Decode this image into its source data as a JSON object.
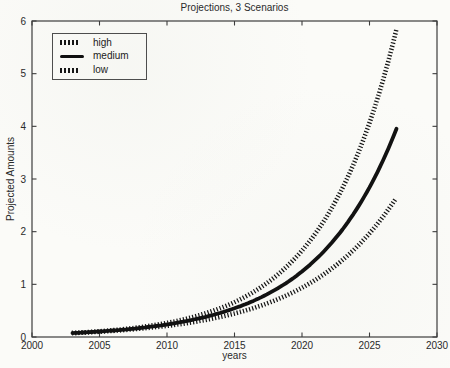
{
  "title": "Projections, 3 Scenarios",
  "axes": {
    "xlabel": "years",
    "ylabel": "Projected Amounts"
  },
  "legend": {
    "items": [
      {
        "label": "high",
        "style": "dotted"
      },
      {
        "label": "medium",
        "style": "solid-thick"
      },
      {
        "label": "low",
        "style": "dotted"
      }
    ],
    "position": "upper-left"
  },
  "colors": {
    "background": "#fbfbf8",
    "axis": "#3d3d3d",
    "text": "#2a2a2a",
    "line_ink": "#121212"
  },
  "chart_data": {
    "type": "line",
    "title": "Projections, 3 Scenarios",
    "xlabel": "years",
    "ylabel": "Projected Amounts",
    "xlim": [
      2000,
      2030
    ],
    "ylim": [
      0,
      6
    ],
    "x_ticks": [
      2000,
      2005,
      2010,
      2015,
      2020,
      2025,
      2030
    ],
    "y_ticks": [
      0,
      1,
      2,
      3,
      4,
      5,
      6
    ],
    "grid": false,
    "legend_position": "upper-left",
    "x": [
      2003,
      2004,
      2005,
      2006,
      2007,
      2008,
      2009,
      2010,
      2011,
      2012,
      2013,
      2014,
      2015,
      2016,
      2017,
      2018,
      2019,
      2020,
      2021,
      2022,
      2023,
      2024,
      2025,
      2026,
      2027
    ],
    "series": [
      {
        "name": "high",
        "style": "dotted",
        "values": [
          0.075,
          0.09,
          0.108,
          0.129,
          0.155,
          0.186,
          0.223,
          0.267,
          0.32,
          0.384,
          0.461,
          0.552,
          0.662,
          0.794,
          0.952,
          1.141,
          1.369,
          1.641,
          1.967,
          2.359,
          2.829,
          3.392,
          4.066,
          4.876,
          5.846
        ]
      },
      {
        "name": "medium",
        "style": "solid",
        "values": [
          0.075,
          0.088,
          0.104,
          0.123,
          0.145,
          0.171,
          0.202,
          0.238,
          0.281,
          0.332,
          0.391,
          0.462,
          0.545,
          0.642,
          0.758,
          0.894,
          1.054,
          1.244,
          1.467,
          1.731,
          2.042,
          2.409,
          2.841,
          3.352,
          3.954
        ]
      },
      {
        "name": "low",
        "style": "dotted",
        "values": [
          0.075,
          0.087,
          0.101,
          0.117,
          0.136,
          0.158,
          0.183,
          0.212,
          0.246,
          0.285,
          0.331,
          0.384,
          0.446,
          0.517,
          0.6,
          0.696,
          0.807,
          0.936,
          1.086,
          1.26,
          1.462,
          1.696,
          1.968,
          2.283,
          2.648
        ]
      }
    ]
  }
}
